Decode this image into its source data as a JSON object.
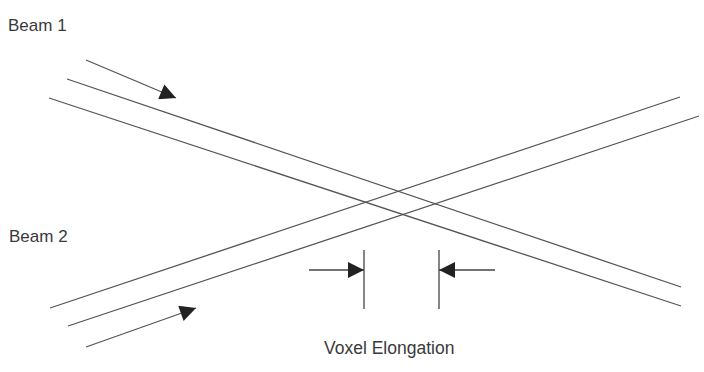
{
  "diagram": {
    "labels": {
      "beam1": "Beam 1",
      "beam2": "Beam 2",
      "voxel": "Voxel Elongation"
    },
    "colors": {
      "line": "#555555",
      "arrow": "#222222",
      "text": "#3a3a3a",
      "background": "#ffffff"
    },
    "beam1": {
      "direction_arrow": {
        "x1": 86,
        "y1": 60,
        "x2": 176,
        "y2": 98
      },
      "edges": [
        {
          "x1": 67,
          "y1": 79,
          "x2": 681,
          "y2": 287
        },
        {
          "x1": 49,
          "y1": 98,
          "x2": 681,
          "y2": 306
        }
      ]
    },
    "beam2": {
      "direction_arrow": {
        "x1": 86,
        "y1": 347,
        "x2": 196,
        "y2": 308
      },
      "edges": [
        {
          "x1": 50,
          "y1": 308,
          "x2": 680,
          "y2": 97
        },
        {
          "x1": 68,
          "y1": 326,
          "x2": 699,
          "y2": 116
        }
      ]
    },
    "voxel_markers": {
      "left": {
        "x": 364,
        "y1": 250,
        "y2": 309,
        "arrow_from": 309,
        "arrow_y": 270
      },
      "right": {
        "x": 439,
        "y1": 250,
        "y2": 309,
        "arrow_from": 495,
        "arrow_y": 270
      }
    }
  }
}
